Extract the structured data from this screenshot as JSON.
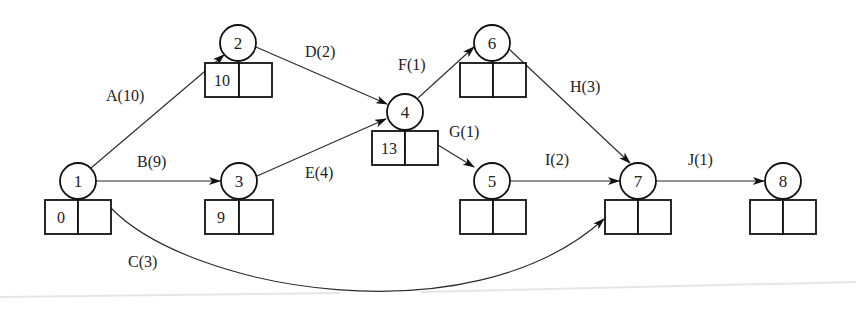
{
  "diagram": {
    "type": "activity-on-arrow network (critical path)",
    "nodes": [
      {
        "id": "1",
        "label": "1",
        "earliest": "0",
        "latest": ""
      },
      {
        "id": "2",
        "label": "2",
        "earliest": "10",
        "latest": ""
      },
      {
        "id": "3",
        "label": "3",
        "earliest": "9",
        "latest": ""
      },
      {
        "id": "4",
        "label": "4",
        "earliest": "13",
        "latest": ""
      },
      {
        "id": "5",
        "label": "5",
        "earliest": "",
        "latest": ""
      },
      {
        "id": "6",
        "label": "6",
        "earliest": "",
        "latest": ""
      },
      {
        "id": "7",
        "label": "7",
        "earliest": "",
        "latest": ""
      },
      {
        "id": "8",
        "label": "8",
        "earliest": "",
        "latest": ""
      }
    ],
    "edges": [
      {
        "from": "1",
        "to": "2",
        "label": "A(10)",
        "activity": "A",
        "duration": 10
      },
      {
        "from": "1",
        "to": "3",
        "label": "B(9)",
        "activity": "B",
        "duration": 9
      },
      {
        "from": "1",
        "to": "7",
        "label": "C(3)",
        "activity": "C",
        "duration": 3
      },
      {
        "from": "2",
        "to": "4",
        "label": "D(2)",
        "activity": "D",
        "duration": 2
      },
      {
        "from": "3",
        "to": "4",
        "label": "E(4)",
        "activity": "E",
        "duration": 4
      },
      {
        "from": "4",
        "to": "6",
        "label": "F(1)",
        "activity": "F",
        "duration": 1
      },
      {
        "from": "4",
        "to": "5",
        "label": "G(1)",
        "activity": "G",
        "duration": 1
      },
      {
        "from": "6",
        "to": "7",
        "label": "H(3)",
        "activity": "H",
        "duration": 3
      },
      {
        "from": "5",
        "to": "7",
        "label": "I(2)",
        "activity": "I",
        "duration": 2
      },
      {
        "from": "7",
        "to": "8",
        "label": "J(1)",
        "activity": "J",
        "duration": 1
      }
    ]
  }
}
